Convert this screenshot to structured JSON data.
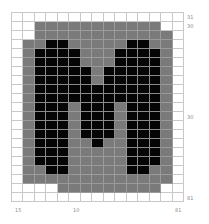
{
  "pattern": {
    "columns": 15,
    "rows": 21,
    "legend": {
      "0": "empty",
      "1": "gray",
      "2": "black"
    },
    "colors": {
      "empty": "#ffffff",
      "gray": "#7a7a7a",
      "black": "#050505",
      "gridline": "#c8c8c8"
    },
    "cells": [
      [
        0,
        0,
        0,
        0,
        0,
        0,
        0,
        0,
        0,
        0,
        0,
        0,
        0,
        0,
        0
      ],
      [
        0,
        0,
        1,
        1,
        1,
        1,
        1,
        1,
        1,
        1,
        1,
        1,
        1,
        0,
        0
      ],
      [
        0,
        0,
        1,
        1,
        1,
        1,
        1,
        1,
        1,
        1,
        1,
        1,
        1,
        1,
        0
      ],
      [
        0,
        1,
        1,
        2,
        2,
        1,
        1,
        1,
        1,
        1,
        2,
        2,
        1,
        1,
        0
      ],
      [
        0,
        1,
        2,
        2,
        2,
        2,
        1,
        1,
        1,
        2,
        2,
        2,
        2,
        1,
        0
      ],
      [
        0,
        1,
        2,
        2,
        2,
        2,
        1,
        1,
        1,
        2,
        2,
        2,
        2,
        1,
        0
      ],
      [
        0,
        1,
        2,
        2,
        2,
        2,
        2,
        1,
        2,
        2,
        2,
        2,
        2,
        1,
        0
      ],
      [
        0,
        1,
        2,
        2,
        2,
        2,
        2,
        1,
        2,
        2,
        2,
        2,
        2,
        1,
        0
      ],
      [
        0,
        1,
        2,
        2,
        2,
        2,
        2,
        2,
        2,
        2,
        2,
        2,
        2,
        1,
        0
      ],
      [
        0,
        1,
        2,
        2,
        2,
        2,
        2,
        2,
        2,
        2,
        2,
        2,
        2,
        1,
        0
      ],
      [
        0,
        1,
        2,
        2,
        2,
        1,
        2,
        2,
        2,
        1,
        2,
        2,
        2,
        1,
        0
      ],
      [
        0,
        1,
        2,
        2,
        2,
        1,
        2,
        2,
        2,
        1,
        2,
        2,
        2,
        1,
        0
      ],
      [
        0,
        1,
        2,
        2,
        2,
        1,
        2,
        2,
        2,
        1,
        2,
        2,
        2,
        1,
        0
      ],
      [
        0,
        1,
        2,
        2,
        2,
        1,
        2,
        2,
        2,
        1,
        2,
        2,
        2,
        1,
        0
      ],
      [
        0,
        1,
        2,
        2,
        2,
        1,
        1,
        2,
        1,
        1,
        2,
        2,
        2,
        1,
        0
      ],
      [
        0,
        1,
        2,
        2,
        2,
        1,
        1,
        1,
        1,
        1,
        2,
        2,
        2,
        1,
        0
      ],
      [
        0,
        1,
        2,
        2,
        2,
        1,
        1,
        1,
        1,
        1,
        2,
        2,
        2,
        1,
        0
      ],
      [
        0,
        1,
        1,
        2,
        2,
        1,
        1,
        1,
        1,
        1,
        2,
        2,
        1,
        1,
        0
      ],
      [
        0,
        1,
        1,
        1,
        1,
        1,
        1,
        1,
        1,
        1,
        1,
        1,
        1,
        1,
        0
      ],
      [
        0,
        0,
        0,
        0,
        1,
        1,
        1,
        1,
        1,
        1,
        1,
        1,
        1,
        0,
        0
      ],
      [
        0,
        0,
        0,
        0,
        0,
        0,
        0,
        0,
        0,
        0,
        0,
        0,
        0,
        0,
        0
      ]
    ]
  },
  "labels": {
    "right": [
      {
        "text": "31",
        "top": 14
      },
      {
        "text": "30",
        "top": 23
      },
      {
        "text": "30",
        "top": 114
      },
      {
        "text": "81",
        "top": 195
      }
    ],
    "bottom": [
      {
        "text": "15",
        "left": 15
      },
      {
        "text": "10",
        "left": 73
      },
      {
        "text": "81",
        "left": 175
      }
    ]
  }
}
